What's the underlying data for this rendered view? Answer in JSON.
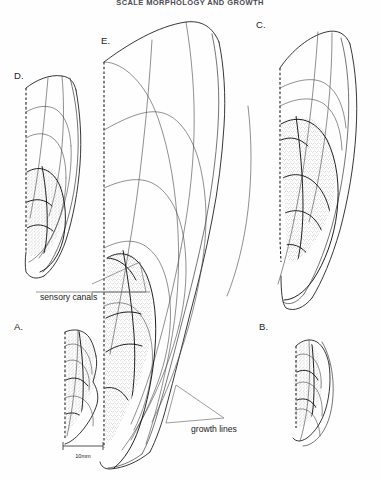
{
  "figure": {
    "title": "SCALE MORPHOLOGY AND GROWTH",
    "title_visible": true,
    "background_color": "#fefefe",
    "ink_color": "#202020",
    "stipple_color": "#8c8c8c"
  },
  "panels": [
    {
      "id": "A",
      "label": "A.",
      "label_x": 14,
      "label_y": 330,
      "broken_margin": true,
      "stippled": true,
      "stipple_coverage": "full"
    },
    {
      "id": "B",
      "label": "B.",
      "label_x": 259,
      "label_y": 330,
      "broken_margin": true,
      "stippled": true,
      "stipple_coverage": "full"
    },
    {
      "id": "C",
      "label": "C.",
      "label_x": 256,
      "label_y": 28,
      "broken_margin": true,
      "stippled": true,
      "stipple_coverage": "posterior-field"
    },
    {
      "id": "D",
      "label": "D.",
      "label_x": 14,
      "label_y": 79,
      "broken_margin": true,
      "stippled": true,
      "stipple_coverage": "lower-field"
    },
    {
      "id": "E",
      "label": "E.",
      "label_x": 101,
      "label_y": 44,
      "broken_margin": true,
      "stippled": true,
      "stipple_coverage": "lower-field"
    }
  ],
  "annotations": [
    {
      "id": "sensory-canals",
      "text": "sensory canals",
      "x": 40,
      "y": 300,
      "anchor": "start",
      "points_to": "canal lines on specimen E"
    },
    {
      "id": "growth-lines",
      "text": "growth lines",
      "x": 191,
      "y": 432,
      "anchor": "start",
      "points_to": "concentric arcs on specimen E"
    }
  ],
  "scale_bar": {
    "label": "10mm",
    "label_x": 82,
    "label_y": 460,
    "bar_x1": 63,
    "bar_x2": 103,
    "bar_y": 446,
    "tick_height": 4,
    "units": "mm",
    "length_value": 10
  }
}
